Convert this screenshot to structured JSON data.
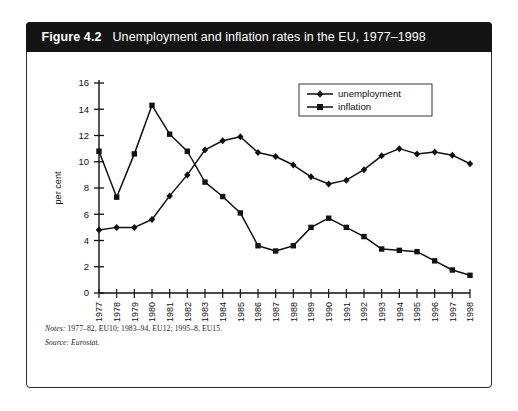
{
  "figure": {
    "number": "Figure 4.2",
    "title": "Unemployment and inflation rates in the EU, 1977–1998",
    "notes_label": "Notes:",
    "notes_text": " 1977–82, EU10; 1983–94, EU12; 1995–8, EU15.",
    "source_label": "Source:",
    "source_text": " Eurostat."
  },
  "colors": {
    "title_bar": "#141414",
    "border": "#2b2b2b",
    "series": "#111111",
    "page_background": "#ffffff"
  },
  "chart_data": {
    "type": "line",
    "title": "Unemployment and inflation rates in the EU, 1977–1998",
    "xlabel": "",
    "ylabel": "per cent",
    "ylim": [
      0,
      16
    ],
    "ytick_step": 2,
    "yticks": [
      0,
      2,
      4,
      6,
      8,
      10,
      12,
      14,
      16
    ],
    "grid": false,
    "legend_position": "top-right",
    "categories": [
      "1977",
      "1978",
      "1979",
      "1980",
      "1981",
      "1982",
      "1983",
      "1984",
      "1985",
      "1986",
      "1987",
      "1988",
      "1989",
      "1990",
      "1991",
      "1992",
      "1993",
      "1994",
      "1995",
      "1996",
      "1997",
      "1998"
    ],
    "series": [
      {
        "name": "unemployment",
        "marker": "diamond",
        "values": [
          4.8,
          5.0,
          5.0,
          5.6,
          7.4,
          9.0,
          10.9,
          11.6,
          11.9,
          10.7,
          10.4,
          9.75,
          8.85,
          8.3,
          8.6,
          9.4,
          10.45,
          11.0,
          10.6,
          10.75,
          10.5,
          9.85
        ]
      },
      {
        "name": "inflation",
        "marker": "square",
        "values": [
          10.8,
          7.3,
          10.6,
          14.3,
          12.1,
          10.8,
          8.45,
          7.35,
          6.1,
          3.6,
          3.2,
          3.6,
          5.0,
          5.7,
          5.0,
          4.3,
          3.35,
          3.25,
          3.15,
          2.45,
          1.75,
          1.35
        ]
      }
    ]
  }
}
